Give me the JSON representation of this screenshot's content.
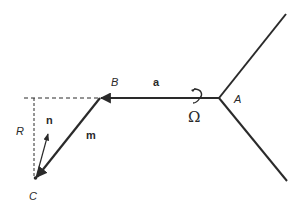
{
  "diagram": {
    "points": {
      "A": "A",
      "B": "B",
      "C": "C"
    },
    "vectors": {
      "a": "a",
      "m": "m",
      "n": "n"
    },
    "radius_label": "R",
    "angular_velocity_symbol": "Ω",
    "colors": {
      "stroke": "#2a2a2a",
      "background": "#ffffff"
    }
  }
}
